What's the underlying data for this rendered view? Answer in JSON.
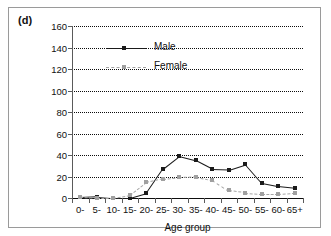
{
  "figure": {
    "panel_label": "(d)",
    "border_color": "#9a9a9a",
    "background": "#ffffff"
  },
  "legend": {
    "position": "top-left-inside",
    "entries": [
      {
        "label": "Male",
        "color": "#1a1a1a",
        "style": "solid",
        "marker": "square"
      },
      {
        "label": "Female",
        "color": "#a6a6a6",
        "style": "dashed",
        "marker": "square"
      }
    ]
  },
  "chart_data": {
    "type": "line",
    "title": "",
    "subtitle": "",
    "xlabel": "Age group",
    "ylabel": "Incidence rate per 100 000",
    "categories": [
      "0-",
      "5-",
      "10-",
      "15-",
      "20-",
      "25-",
      "30-",
      "35-",
      "40-",
      "45-",
      "50-",
      "55-",
      "60-",
      "65+"
    ],
    "yticks": [
      0,
      20,
      40,
      60,
      80,
      100,
      120,
      140,
      160
    ],
    "ylim": [
      0,
      160
    ],
    "grid": "horizontal-dotted",
    "legend_position": "upper left",
    "series": [
      {
        "name": "Male",
        "color": "#1a1a1a",
        "style": "solid",
        "values": [
          0.5,
          1.2,
          0,
          0,
          4.5,
          27,
          39,
          35,
          27,
          26.5,
          31.5,
          14,
          11,
          9.5
        ]
      },
      {
        "name": "Female",
        "color": "#a6a6a6",
        "style": "dashed",
        "values": [
          0.5,
          0,
          0,
          2.5,
          14.5,
          18,
          19.5,
          20,
          17,
          7,
          5,
          4,
          4,
          5
        ]
      }
    ]
  }
}
